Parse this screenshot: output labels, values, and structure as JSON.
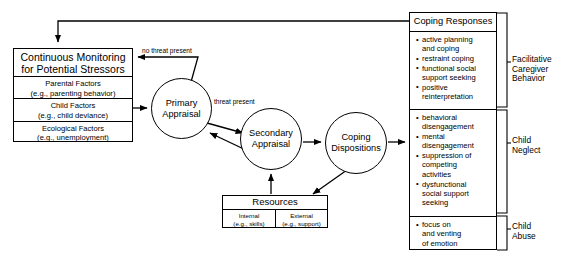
{
  "diagram": {
    "stroke_color": "#000000",
    "background_color": "#ffffff"
  },
  "monitoring": {
    "title": "Continuous Monitoring\nfor Potential Stressors",
    "factors": [
      "Parental Factors\n(e.g., parenting behavior)",
      "Child Factors\n(e.g., child deviance)",
      "Ecological Factors\n(e.g., unemployment)"
    ]
  },
  "appraisal": {
    "primary": "Primary\nAppraisal",
    "secondary": "Secondary\nAppraisal",
    "dispositions": "Coping\nDispositions"
  },
  "resources": {
    "title": "Resources",
    "columns": [
      "Internal\n(e.g., skills)",
      "External\n(e.g., support)"
    ]
  },
  "coping_responses": {
    "title": "Coping Responses",
    "sections": [
      {
        "items": [
          "active planning\nand coping",
          "restraint coping",
          "functional social\nsupport seeking",
          "positive\nreinterpretation"
        ]
      },
      {
        "items": [
          "behavioral\ndisengagement",
          "mental\ndisengagement",
          "suppression of\ncompeting\nactivities",
          "dysfunctional\nsocial support\nseeking"
        ]
      },
      {
        "items": [
          "focus on\nand venting\nof emotion"
        ]
      }
    ]
  },
  "outcome_brackets": [
    "Facilitative\nCaregiver\nBehavior",
    "Child\nNeglect",
    "Child\nAbuse"
  ],
  "edge_labels": {
    "no_threat": "no threat present",
    "threat": "threat present"
  }
}
